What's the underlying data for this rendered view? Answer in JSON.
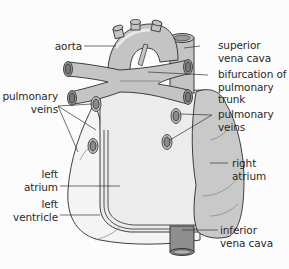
{
  "diagram": {
    "type": "anatomical-diagram",
    "colors": {
      "background": "#fcfcfc",
      "vessel_fill": "#c4c4c4",
      "right_atrium_fill": "#c9c9c9",
      "left_heart_fill": "#ececec",
      "ivc_fill": "#8e8e8e",
      "vessel_lumen": "#7a7a7a",
      "outline": "#2b2b2b",
      "leader_line": "#333333",
      "text": "#2a2a2a"
    },
    "labels": {
      "aorta": "aorta",
      "pulmonary_veins_left": "pulmonary\nveins",
      "left_atrium": "left\natrium",
      "left_ventricle": "left\nventricle",
      "superior_vena_cava": "superior\nvena cava",
      "bifurcation": "bifurcation of\npulmonary\ntrunk",
      "pulmonary_veins_right": "pulmonary\nveins",
      "right_atrium": "right\natrium",
      "inferior_vena_cava": "inferior\nvena cava"
    }
  }
}
